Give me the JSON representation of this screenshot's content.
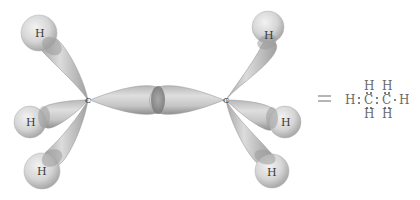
{
  "diagram": {
    "molecule": "ethane",
    "carbon_label": "C",
    "hydrogen_label": "H",
    "left_carbon": {
      "label": "C",
      "hydrogens": [
        "H",
        "H",
        "H"
      ]
    },
    "right_carbon": {
      "label": "C",
      "hydrogens": [
        "H",
        "H",
        "H"
      ]
    },
    "equals_symbol": "=",
    "lewis_structure": {
      "top_h_left": "H",
      "top_h_right": "H",
      "left_h": "H",
      "c1": "C",
      "c2": "C",
      "right_h": "H",
      "bottom_h_left": "H",
      "bottom_h_right": "H"
    },
    "colors": {
      "lobe_fill": "#c8c8c8",
      "lobe_edge": "#8a8a8a",
      "overlap": "#8c8c8c",
      "hydrogen_fill": "#d8d8d8",
      "text": "#3a3a3a",
      "lewis_text": "#6a6a6a"
    }
  }
}
